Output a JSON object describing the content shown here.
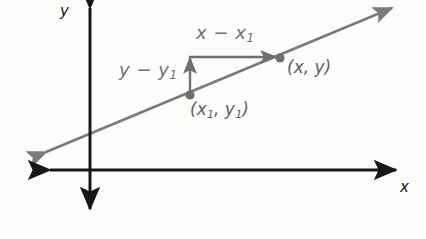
{
  "figure": {
    "width": 426,
    "height": 239,
    "background_color": "#fdfdfc"
  },
  "axes": {
    "color": "#171717",
    "x_label": "x",
    "y_label": "y",
    "origin": {
      "x": 90,
      "y": 170
    },
    "x_axis": {
      "start_x": 48,
      "end_x": 398,
      "y": 170,
      "arrow_both_ends": true
    },
    "y_axis": {
      "x": 90,
      "start_y": 4,
      "end_y": 213,
      "arrow_both_ends": true
    }
  },
  "line": {
    "name": "sloped-line",
    "color": "#7a7a7a",
    "arrow_both_ends": true,
    "start": {
      "x": 46,
      "y": 152
    },
    "end": {
      "x": 392,
      "y": 8
    }
  },
  "points": [
    {
      "name": "point-x1-y1",
      "label": "(x1, y1)",
      "label_base": "(x",
      "label_sub1": "1",
      "label_mid": ", y",
      "label_sub2": "1",
      "label_end": ")",
      "x": 190,
      "y": 95,
      "color": "#6f6f6f"
    },
    {
      "name": "point-x-y",
      "label": "(x, y)",
      "x": 280,
      "y": 58,
      "color": "#6f6f6f"
    }
  ],
  "annotations": {
    "run": {
      "name": "run-annotation",
      "text_base": "x",
      "text_minus": " − ",
      "text_var": "x",
      "text_sub": "1",
      "full_text": "x − x1",
      "arrow_from": {
        "x": 190,
        "y": 57
      },
      "arrow_to": {
        "x": 278,
        "y": 57
      },
      "color": "#6f6f6f"
    },
    "rise": {
      "name": "rise-annotation",
      "text_base": "y",
      "text_minus": " − ",
      "text_var": "y",
      "text_sub": "1",
      "full_text": "y − y1",
      "arrow_from": {
        "x": 190,
        "y": 94
      },
      "arrow_to": {
        "x": 190,
        "y": 56
      },
      "color": "#6f6f6f"
    }
  },
  "colors": {
    "axis": "#171717",
    "line": "#7a7a7a",
    "annotation": "#6f6f6f",
    "point": "#6f6f6f",
    "background": "#fdfdfc"
  }
}
